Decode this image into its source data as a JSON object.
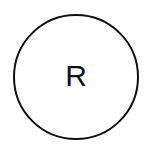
{
  "avatar": {
    "initial": "R",
    "border_color": "#111111",
    "text_color": "#111111",
    "background": "#ffffff"
  }
}
